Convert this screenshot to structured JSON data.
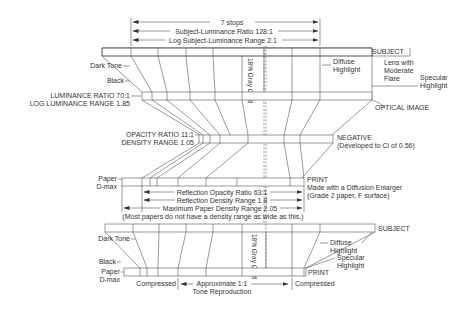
{
  "top_arrows": {
    "stops": "7 stops",
    "ratio": "Subject-Luminance Ratio 128:1",
    "range": "Log Subject-Luminance Range 2.1"
  },
  "subject": {
    "label": "SUBJECT",
    "dark_tone": "Dark Tone",
    "black": "Black",
    "gray_card": "18% Gray Card",
    "diffuse_1": "Diffuse",
    "diffuse_2": "Highlight",
    "flare_1": "Lens with",
    "flare_2": "Moderate",
    "flare_3": "Flare",
    "specular_1": "Specular",
    "specular_2": "Highlight"
  },
  "optical": {
    "label": "OPTICAL IMAGE",
    "ratio": "LUMINANCE RATIO 70:1",
    "range": "LOG LUMINANCE RANGE 1.85"
  },
  "negative": {
    "label": "NEGATIVE",
    "note": "(Developed to Ci of 0.56)",
    "ratio": "OPACITY RATIO 11:1",
    "range": "DENSITY RANGE 1.05"
  },
  "print": {
    "label": "PRINT",
    "note_1": "Made with a Diffusion Enlarger",
    "note_2": "(Grade 2 paper, F surface)",
    "paper_1": "Paper",
    "paper_2": "D-max",
    "opacity": "Reflection Opacity Ratio 63:1",
    "density": "Reflection Density Range 1.8",
    "max_density": "Maximum Paper Density Range 2.05",
    "max_note": "(Most papers do not have a density range as wide as this.)"
  },
  "bottom": {
    "subject": "SUBJECT",
    "print": "PRINT",
    "dark_tone": "Dark Tone",
    "black": "Black",
    "paper_1": "Paper",
    "paper_2": "D-max",
    "gray_card": "18% Gray Card",
    "diffuse_1": "Diffuse",
    "diffuse_2": "Highlight",
    "specular_1": "Specular",
    "specular_2": "Highlight",
    "compressed_left": "Compressed",
    "compressed_right": "Compressed",
    "approx_1": "Approximate 1:1",
    "approx_2": "Tone Reproduction"
  }
}
